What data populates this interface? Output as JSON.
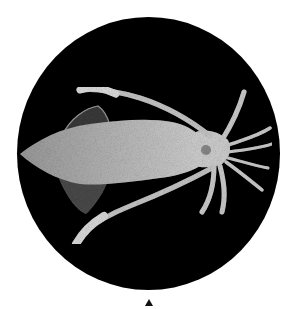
{
  "image": {
    "subject": "squid specimen",
    "description": "Photograph of a squid, viewed from above, pale grey on a black circular background, with a small black triangle marker below the circle",
    "background_color": "#ffffff",
    "circle_color": "#000000",
    "specimen_color": "#c8c8c8"
  },
  "marker": {
    "shape": "triangle-up",
    "color": "#111111"
  }
}
